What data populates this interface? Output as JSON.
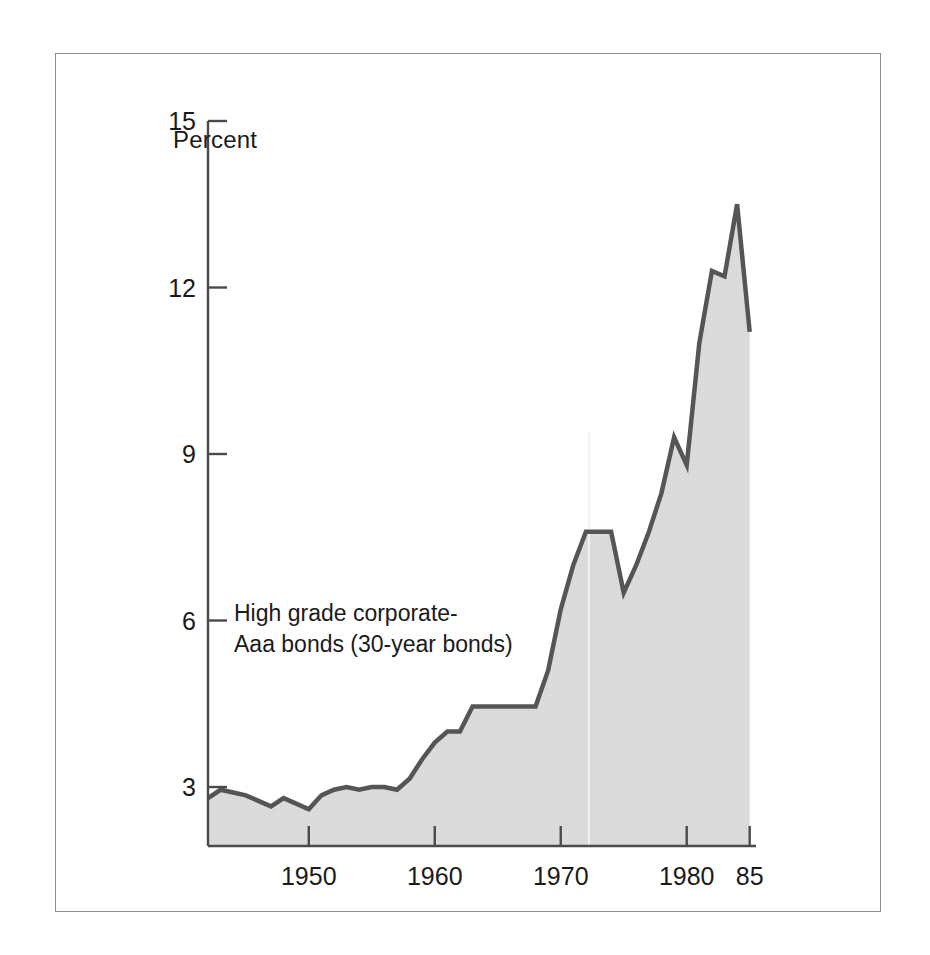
{
  "figure": {
    "axis_title": "Percent",
    "series_label_line1": "High grade corporate-",
    "series_label_line2": "Aaa bonds (30-year bonds)"
  },
  "colors": {
    "line": "#555555",
    "fill": "#d9d9d9",
    "axis": "#4a4a4a",
    "frame": "#8d8d8d",
    "text": "#1a1a1a",
    "background": "#ffffff"
  },
  "chart_data": {
    "type": "area",
    "title": "",
    "subtitle": "",
    "xlabel": "",
    "ylabel": "Percent",
    "ylim": [
      0,
      15
    ],
    "xlim": [
      1942,
      1985.5
    ],
    "grid": false,
    "legend_position": "inside-left",
    "annotations": [
      "High grade corporate-",
      "Aaa bonds (30-year bonds)"
    ],
    "ytick_labels": [
      "15",
      "12",
      "9",
      "6",
      "3"
    ],
    "ytick_values": [
      15,
      12,
      9,
      6,
      3
    ],
    "xtick_labels": [
      "1950",
      "1960",
      "1970",
      "1980",
      "85"
    ],
    "xtick_values": [
      1950,
      1960,
      1970,
      1980,
      1985
    ],
    "series": [
      {
        "name": "High grade corporate-Aaa bonds (30-year bonds)",
        "x": [
          1942,
          1943,
          1944,
          1945,
          1946,
          1947,
          1948,
          1949,
          1950,
          1951,
          1952,
          1953,
          1954,
          1955,
          1956,
          1957,
          1958,
          1959,
          1960,
          1961,
          1962,
          1963,
          1964,
          1965,
          1966,
          1967,
          1968,
          1969,
          1970,
          1971,
          1972,
          1973,
          1974,
          1975,
          1976,
          1977,
          1978,
          1979,
          1980,
          1981,
          1982,
          1983,
          1984,
          1985
        ],
        "values": [
          2.8,
          2.95,
          2.9,
          2.85,
          2.75,
          2.65,
          2.8,
          2.7,
          2.6,
          2.85,
          2.95,
          3.0,
          2.95,
          3.0,
          3.0,
          2.95,
          3.15,
          3.5,
          3.8,
          4.0,
          4.0,
          4.45,
          4.45,
          4.45,
          4.45,
          4.45,
          4.45,
          5.1,
          6.2,
          7.0,
          7.6,
          7.6,
          7.6,
          6.5,
          7.0,
          7.6,
          8.3,
          9.3,
          8.8,
          11.0,
          12.3,
          12.2,
          13.5,
          11.2
        ]
      }
    ]
  },
  "geometry": {
    "plot_left_px": 207,
    "plot_right_px": 755,
    "plot_baseline_px": 845,
    "y15_px": 120,
    "y3_px": 786
  }
}
